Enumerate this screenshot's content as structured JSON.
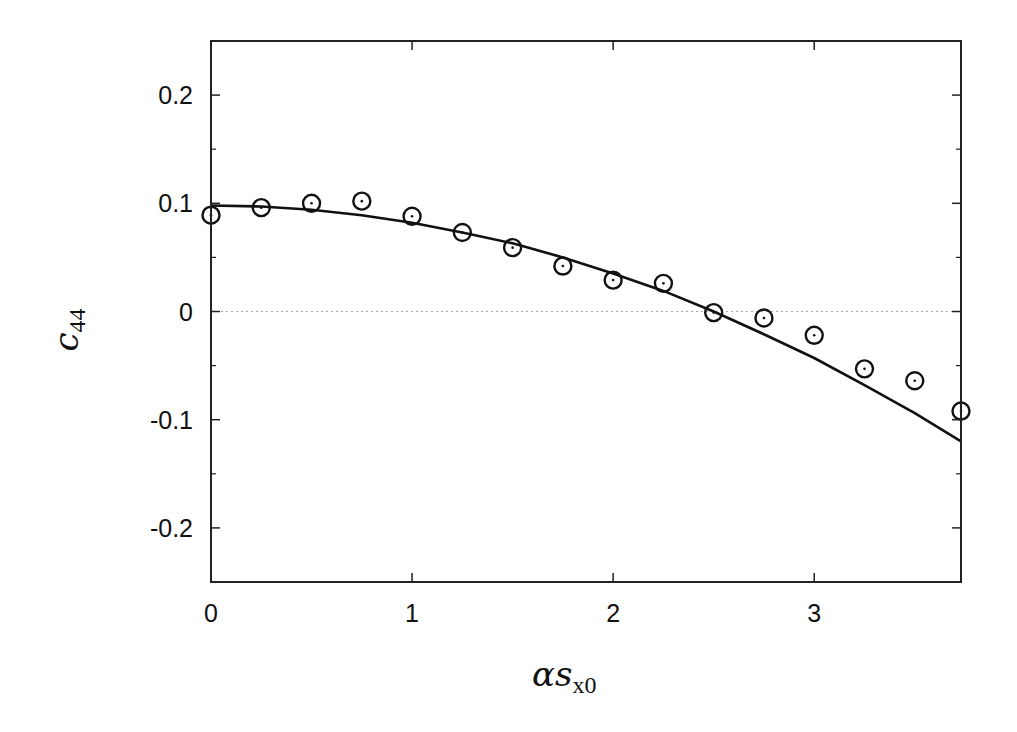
{
  "chart_data": {
    "type": "scatter",
    "title": "",
    "xlabel": "αs_x0",
    "xlabel_main": "αs",
    "xlabel_sub": "x0",
    "ylabel": "c_44",
    "ylabel_main": "c",
    "ylabel_sub": "44",
    "xlim": [
      0,
      3.73
    ],
    "ylim": [
      -0.25,
      0.25
    ],
    "x_ticks": [
      0,
      1,
      2,
      3
    ],
    "x_tick_labels": [
      "0",
      "1",
      "2",
      "3"
    ],
    "x_minor_ticks": [],
    "y_ticks": [
      0.2,
      0.1,
      0,
      -0.1,
      -0.2
    ],
    "y_tick_labels": [
      "0.2",
      "0.1",
      "0",
      "-0.1",
      "-0.2"
    ],
    "y_minor_ticks": [
      0.15,
      0.05,
      -0.05,
      -0.15
    ],
    "grid": false,
    "zero_line": {
      "y": 0,
      "style": "dotted",
      "color": "#aaaaaa"
    },
    "legend": null,
    "series": [
      {
        "name": "data (circles)",
        "kind": "scatter",
        "marker": "circle-dot",
        "color": "#111111",
        "x": [
          0,
          0.25,
          0.5,
          0.75,
          1.0,
          1.25,
          1.5,
          1.75,
          2.0,
          2.25,
          2.5,
          2.75,
          3.0,
          3.25,
          3.5,
          3.73
        ],
        "y": [
          0.089,
          0.096,
          0.1,
          0.102,
          0.088,
          0.073,
          0.059,
          0.042,
          0.029,
          0.026,
          -0.001,
          -0.006,
          -0.022,
          -0.053,
          -0.064,
          -0.092
        ]
      },
      {
        "name": "fit (solid line)",
        "kind": "line",
        "color": "#111111",
        "x": [
          0,
          0.25,
          0.5,
          0.75,
          1.0,
          1.25,
          1.5,
          1.75,
          2.0,
          2.25,
          2.5,
          2.75,
          3.0,
          3.25,
          3.5,
          3.73
        ],
        "y": [
          0.098,
          0.097,
          0.094,
          0.089,
          0.082,
          0.073,
          0.063,
          0.05,
          0.035,
          0.019,
          0.0,
          -0.021,
          -0.043,
          -0.068,
          -0.094,
          -0.12
        ]
      }
    ]
  }
}
